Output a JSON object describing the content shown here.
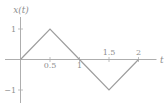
{
  "chart_data": {
    "type": "line",
    "xlabel": "t",
    "ylabel": "x(t)",
    "x": [
      0,
      0.5,
      1,
      1.5,
      2
    ],
    "y": [
      0,
      1,
      0,
      -1,
      0
    ],
    "xlim": [
      -0.25,
      2.3
    ],
    "ylim": [
      -1.4,
      1.4
    ],
    "grid": false,
    "legend": null,
    "xticks": [
      {
        "t": 0.5,
        "label": "0.5",
        "side": "below"
      },
      {
        "t": 1,
        "label": "1",
        "side": "below"
      },
      {
        "t": 1.5,
        "label": "1.5",
        "side": "above"
      },
      {
        "t": 2,
        "label": "2",
        "side": "above"
      }
    ],
    "yticks": [
      {
        "v": 1,
        "label": "1"
      },
      {
        "v": -1,
        "label": "−1"
      }
    ],
    "colors": {
      "line": "#9d9d9d",
      "axis": "#aeaeae",
      "text": "#8e8e8e",
      "background": "#ffffff"
    }
  }
}
